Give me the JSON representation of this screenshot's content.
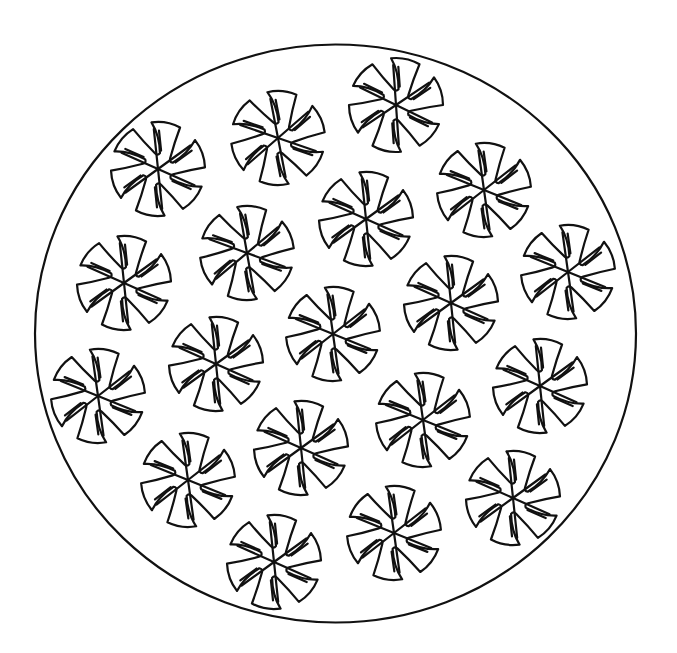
{
  "artwork": {
    "type": "coloring-page",
    "background_color": "#ffffff",
    "line_color": "#111111",
    "border": {
      "shape": "ellipse",
      "cx": 335.5,
      "cy": 333.5,
      "rx": 300.5,
      "ry": 289
    },
    "motif": {
      "name": "pinwheel-flower",
      "radius": 47,
      "notch_count": 6,
      "inner_radius": 16,
      "spoke_length": 40
    },
    "motifs": [
      {
        "cx": 158,
        "cy": 169,
        "rot": 10
      },
      {
        "cx": 278,
        "cy": 138,
        "rot": 5
      },
      {
        "cx": 396,
        "cy": 105,
        "rot": 12
      },
      {
        "cx": 484,
        "cy": 190,
        "rot": 8
      },
      {
        "cx": 366,
        "cy": 219,
        "rot": 10
      },
      {
        "cx": 247,
        "cy": 253,
        "rot": 6
      },
      {
        "cx": 124,
        "cy": 283,
        "rot": 10
      },
      {
        "cx": 568,
        "cy": 272,
        "rot": 8
      },
      {
        "cx": 451,
        "cy": 303,
        "rot": 10
      },
      {
        "cx": 333,
        "cy": 334,
        "rot": 8
      },
      {
        "cx": 216,
        "cy": 364,
        "rot": 10
      },
      {
        "cx": 98,
        "cy": 396,
        "rot": 8
      },
      {
        "cx": 540,
        "cy": 386,
        "rot": 10
      },
      {
        "cx": 423,
        "cy": 420,
        "rot": 8
      },
      {
        "cx": 301,
        "cy": 448,
        "rot": 10
      },
      {
        "cx": 188,
        "cy": 480,
        "rot": 8
      },
      {
        "cx": 513,
        "cy": 498,
        "rot": 10
      },
      {
        "cx": 394,
        "cy": 533,
        "rot": 8
      },
      {
        "cx": 274,
        "cy": 562,
        "rot": 10
      }
    ]
  }
}
